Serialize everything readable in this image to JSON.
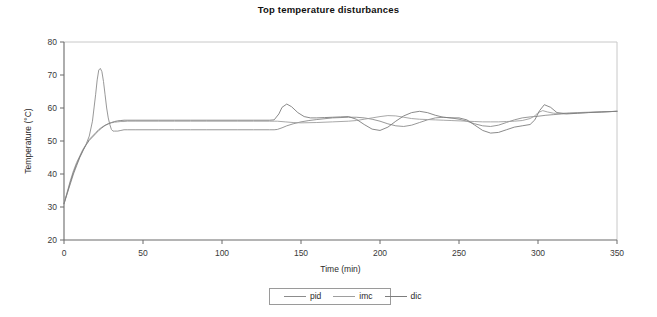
{
  "chart_data": {
    "type": "line",
    "title": "Top temperature disturbances",
    "xlabel": "Time (min)",
    "ylabel": "Temperature (°C)",
    "xlim": [
      0,
      350
    ],
    "ylim": [
      20,
      80
    ],
    "xticks": [
      0,
      50,
      100,
      150,
      200,
      250,
      300,
      350
    ],
    "yticks": [
      20,
      30,
      40,
      50,
      60,
      70,
      80
    ],
    "grid": false,
    "legend_position": "bottom-center",
    "series": [
      {
        "name": "pid",
        "color": "#8c8c8c",
        "x": [
          0,
          2,
          4,
          6,
          8,
          10,
          12,
          14,
          16,
          18,
          20,
          21,
          22,
          23,
          24,
          25,
          26,
          27,
          28,
          29,
          30,
          31,
          32,
          33,
          34,
          36,
          38,
          40,
          45,
          50,
          60,
          70,
          80,
          90,
          100,
          110,
          120,
          130,
          133,
          135,
          138,
          141,
          145,
          150,
          155,
          160,
          170,
          180,
          185,
          190,
          195,
          200,
          205,
          210,
          215,
          220,
          225,
          230,
          235,
          240,
          245,
          250,
          255,
          260,
          265,
          270,
          275,
          280,
          285,
          290,
          295,
          300,
          305,
          310,
          315,
          320,
          330,
          340,
          350
        ],
        "y": [
          31,
          34,
          37,
          40,
          42.5,
          45,
          47,
          49,
          51.5,
          56,
          64,
          68.5,
          71.5,
          72,
          71,
          68,
          64,
          60,
          57,
          55,
          53.5,
          53,
          53,
          53,
          53,
          53.2,
          53.4,
          53.4,
          53.4,
          53.4,
          53.4,
          53.4,
          53.4,
          53.4,
          53.4,
          53.4,
          53.4,
          53.4,
          53.4,
          53.5,
          54,
          54.6,
          55.2,
          55.8,
          56.2,
          56.5,
          57,
          57.2,
          57.2,
          57,
          56.6,
          56,
          55.2,
          54.6,
          54.4,
          54.8,
          55.6,
          56.4,
          57,
          57.2,
          57,
          56.6,
          56,
          55.2,
          54.6,
          54.4,
          54.8,
          55.6,
          56.4,
          57,
          57.3,
          57.5,
          57.8,
          58,
          58.2,
          58.4,
          58.6,
          58.8,
          59
        ],
        "linewidth": 0.9
      },
      {
        "name": "imc",
        "color": "#9e9e9e",
        "x": [
          0,
          2,
          4,
          6,
          8,
          10,
          12,
          14,
          16,
          18,
          20,
          22,
          24,
          26,
          28,
          30,
          32,
          34,
          36,
          38,
          40,
          45,
          50,
          60,
          70,
          80,
          90,
          100,
          110,
          120,
          130,
          133,
          135,
          140,
          145,
          150,
          160,
          170,
          180,
          185,
          190,
          195,
          200,
          205,
          210,
          215,
          220,
          225,
          230,
          235,
          240,
          245,
          250,
          255,
          260,
          265,
          270,
          275,
          280,
          285,
          290,
          295,
          298,
          300,
          303,
          306,
          310,
          315,
          320,
          325,
          330,
          340,
          350
        ],
        "y": [
          31,
          34.5,
          38,
          41,
          43.5,
          45.5,
          47.5,
          49,
          50.5,
          51.5,
          52.5,
          53.5,
          54.2,
          54.8,
          55.2,
          55.5,
          55.7,
          55.8,
          55.9,
          55.9,
          56,
          56,
          56,
          56,
          56,
          56,
          56,
          56,
          56,
          56,
          56,
          56,
          56,
          55.8,
          55.6,
          55.5,
          55.6,
          55.8,
          56,
          56.2,
          56.6,
          57,
          57.4,
          57.7,
          57.6,
          57.2,
          56.8,
          56.6,
          56.5,
          56.4,
          56.3,
          56.2,
          56.1,
          56,
          55.9,
          55.8,
          55.8,
          55.8,
          55.9,
          56,
          56.2,
          56.8,
          57.6,
          58.6,
          59.2,
          58.8,
          58.4,
          58.4,
          58.5,
          58.6,
          58.7,
          58.8,
          59
        ],
        "linewidth": 0.9
      },
      {
        "name": "dic",
        "color": "#7d7d7d",
        "x": [
          0,
          2,
          4,
          6,
          8,
          10,
          12,
          14,
          16,
          18,
          20,
          22,
          24,
          26,
          28,
          30,
          32,
          34,
          36,
          38,
          40,
          45,
          50,
          60,
          70,
          80,
          90,
          100,
          110,
          120,
          130,
          133,
          136,
          138,
          141,
          144,
          148,
          152,
          156,
          160,
          165,
          170,
          175,
          180,
          185,
          190,
          195,
          200,
          205,
          210,
          215,
          220,
          225,
          230,
          235,
          240,
          245,
          250,
          255,
          260,
          265,
          270,
          275,
          280,
          285,
          290,
          295,
          298,
          301,
          304,
          308,
          312,
          318,
          325,
          332,
          340,
          350
        ],
        "y": [
          31,
          34.2,
          37.5,
          40.5,
          43,
          45.2,
          47.2,
          48.8,
          50.2,
          51.2,
          52.2,
          53.2,
          54,
          54.7,
          55.2,
          55.6,
          55.9,
          56.1,
          56.2,
          56.3,
          56.3,
          56.3,
          56.3,
          56.3,
          56.3,
          56.3,
          56.3,
          56.3,
          56.3,
          56.3,
          56.3,
          56.4,
          58.2,
          60.2,
          61.2,
          60.4,
          58.6,
          57.4,
          57,
          57,
          57.1,
          57.2,
          57.3,
          57.4,
          56.6,
          55,
          53.6,
          53.2,
          54.2,
          56,
          57.6,
          58.6,
          59,
          58.6,
          57.8,
          57.2,
          57,
          57,
          56.4,
          54.8,
          53.2,
          52.4,
          52.6,
          53.4,
          54.2,
          54.6,
          55,
          56.4,
          59.2,
          61,
          60.2,
          58.6,
          58.2,
          58.4,
          58.6,
          58.8,
          59
        ],
        "linewidth": 0.9
      }
    ]
  },
  "legend": {
    "items": [
      {
        "label": "pid"
      },
      {
        "label": "imc"
      },
      {
        "label": "dic"
      }
    ]
  },
  "axes": {
    "x_tick_labels": [
      "0",
      "50",
      "100",
      "150",
      "200",
      "250",
      "300",
      "350"
    ],
    "y_tick_labels": [
      "20",
      "30",
      "40",
      "50",
      "60",
      "70",
      "80"
    ]
  },
  "colors": {
    "axis": "#6b6b6b",
    "frame": "#c8c8c8",
    "text": "#2a2a2a",
    "background": "#ffffff"
  }
}
